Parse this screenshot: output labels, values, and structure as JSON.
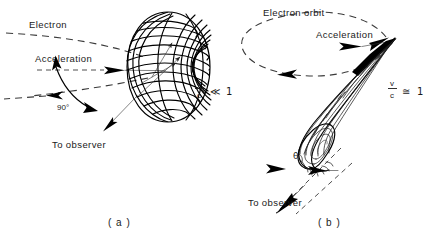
{
  "figure": {
    "title_alt": "Radiation pattern of an accelerated electron",
    "background_color": "#ffffff",
    "ink_color": "#000000"
  },
  "panels": [
    {
      "id": "a",
      "caption": "( a )",
      "regime_label": {
        "numerator": "v",
        "denominator": "c",
        "relation": "≪",
        "value": "1"
      },
      "labels": {
        "electron": "Electron",
        "acceleration": "Acceleration",
        "angle": "90°",
        "observer": "To  observer"
      },
      "pattern_type": "dipole-torus"
    },
    {
      "id": "b",
      "caption": "( b )",
      "regime_label": {
        "numerator": "v",
        "denominator": "c",
        "relation": "≅",
        "value": "1"
      },
      "labels": {
        "orbit": "Electron  orbit",
        "acceleration": "Acceleration",
        "angle": "θ",
        "observer": "To  observer"
      },
      "pattern_type": "forward-beamed-cone"
    }
  ]
}
